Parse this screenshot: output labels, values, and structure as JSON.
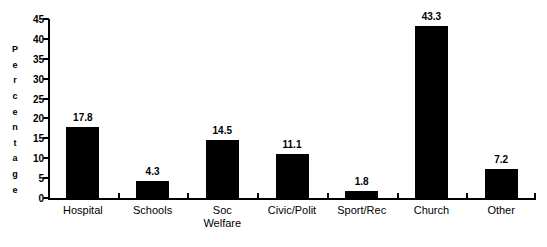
{
  "chart_data": {
    "type": "bar",
    "title": "",
    "xlabel": "",
    "ylabel": "Percentage",
    "categories": [
      "Hospital",
      "Schools",
      "Soc Welfare",
      "Civic/Polit",
      "Sport/Rec",
      "Church",
      "Other"
    ],
    "category_labels_wrapped": [
      "Hospital",
      "Schools",
      "Soc\nWelfare",
      "Civic/Polit",
      "Sport/Rec",
      "Church",
      "Other"
    ],
    "values": [
      17.8,
      4.3,
      14.5,
      11.1,
      1.8,
      43.3,
      7.2
    ],
    "value_labels": [
      "17.8",
      "4.3",
      "14.5",
      "11.1",
      "1.8",
      "43.3",
      "7.2"
    ],
    "ylim": [
      0,
      45
    ],
    "ytick_values": [
      0,
      5,
      10,
      15,
      20,
      25,
      30,
      35,
      40,
      45
    ],
    "ytick_labels": [
      "0",
      "5",
      "10",
      "15",
      "20",
      "25",
      "30",
      "35",
      "40",
      "45"
    ],
    "grid": false,
    "legend": false,
    "bar_color": "#000000",
    "background_color": "#ffffff",
    "axis_color": "#000000"
  },
  "axis_title_letters": [
    "P",
    "e",
    "r",
    "c",
    "e",
    "n",
    "t",
    "a",
    "g",
    "e"
  ]
}
